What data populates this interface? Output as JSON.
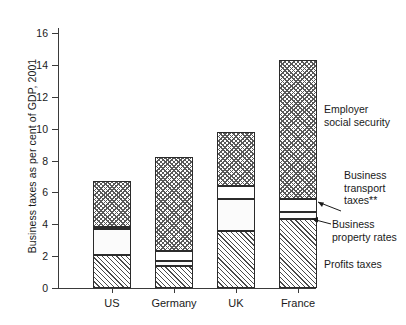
{
  "chart_data": {
    "type": "bar",
    "subtype": "stacked-bar",
    "title": "",
    "xlabel": "",
    "ylabel": "Business taxes as per cent of GDP, 2001",
    "categories": [
      "US",
      "Germany",
      "UK",
      "France"
    ],
    "ylim": [
      0,
      17
    ],
    "yticks": [
      0,
      2,
      4,
      6,
      8,
      10,
      12,
      14,
      16
    ],
    "ytick_labels": [
      "0",
      "2",
      "4",
      "6",
      "8",
      "10",
      "12",
      "14",
      "16"
    ],
    "grid": false,
    "legend_position": "right-annotations",
    "stack_order_bottom_to_top": [
      "Profits taxes",
      "Business property rates",
      "Business transport taxes**",
      "Employer social security"
    ],
    "series": [
      {
        "name": "Profits taxes",
        "pattern": "diagonal-hatch",
        "values": [
          2.1,
          1.4,
          3.6,
          4.3
        ]
      },
      {
        "name": "Business property rates",
        "pattern": "speckle-dots",
        "values": [
          1.6,
          0.3,
          2.0,
          0.5
        ]
      },
      {
        "name": "Business transport taxes**",
        "pattern": "plain-white",
        "values": [
          0.1,
          0.6,
          0.8,
          0.8
        ]
      },
      {
        "name": "Employer social security",
        "pattern": "wavy-crosshatch",
        "values": [
          2.9,
          5.9,
          3.4,
          8.7
        ]
      }
    ],
    "totals": [
      6.7,
      8.2,
      9.8,
      14.3
    ],
    "annotations": [
      {
        "label": "Employer\nsocial security",
        "target_series": "Employer social security"
      },
      {
        "label": "Business\ntransport\ntaxes**",
        "target_series": "Business transport taxes**"
      },
      {
        "label": "Business\nproperty rates",
        "target_series": "Business property rates"
      },
      {
        "label": "Profits taxes",
        "target_series": "Profits taxes"
      }
    ]
  },
  "axis": {
    "ylabel": "Business taxes as per cent of GDP, 2001",
    "yticks": [
      "0",
      "2",
      "4",
      "6",
      "8",
      "10",
      "12",
      "14",
      "16"
    ],
    "xlabels": [
      "US",
      "Germany",
      "UK",
      "France"
    ]
  },
  "annotations": {
    "employer_social_security": "Employer\nsocial security",
    "business_transport_taxes": "Business\ntransport\ntaxes**",
    "business_property_rates": "Business\nproperty rates",
    "profits_taxes": "Profits taxes"
  },
  "colors": {
    "axis": "#3a3a3a",
    "outline": "#2b2b2b",
    "text": "#1a1a1a",
    "background": "#ffffff"
  }
}
